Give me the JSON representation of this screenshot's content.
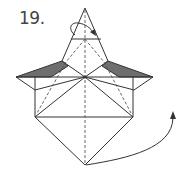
{
  "step": {
    "number_label": "19."
  },
  "diagram": {
    "colors": {
      "line": "#333333",
      "shade": "#6e6e6e",
      "background": "#ffffff"
    },
    "elements": [
      {
        "type": "valley-fold-dashed-line",
        "description": "vertical center crease"
      },
      {
        "type": "rotate-arrow",
        "description": "curved arrow at top indicating flip/turn of point"
      },
      {
        "type": "shaded-flap",
        "side": "left"
      },
      {
        "type": "shaded-flap",
        "side": "right"
      },
      {
        "type": "curved-arrow",
        "description": "swing bottom point up to the right"
      }
    ]
  }
}
